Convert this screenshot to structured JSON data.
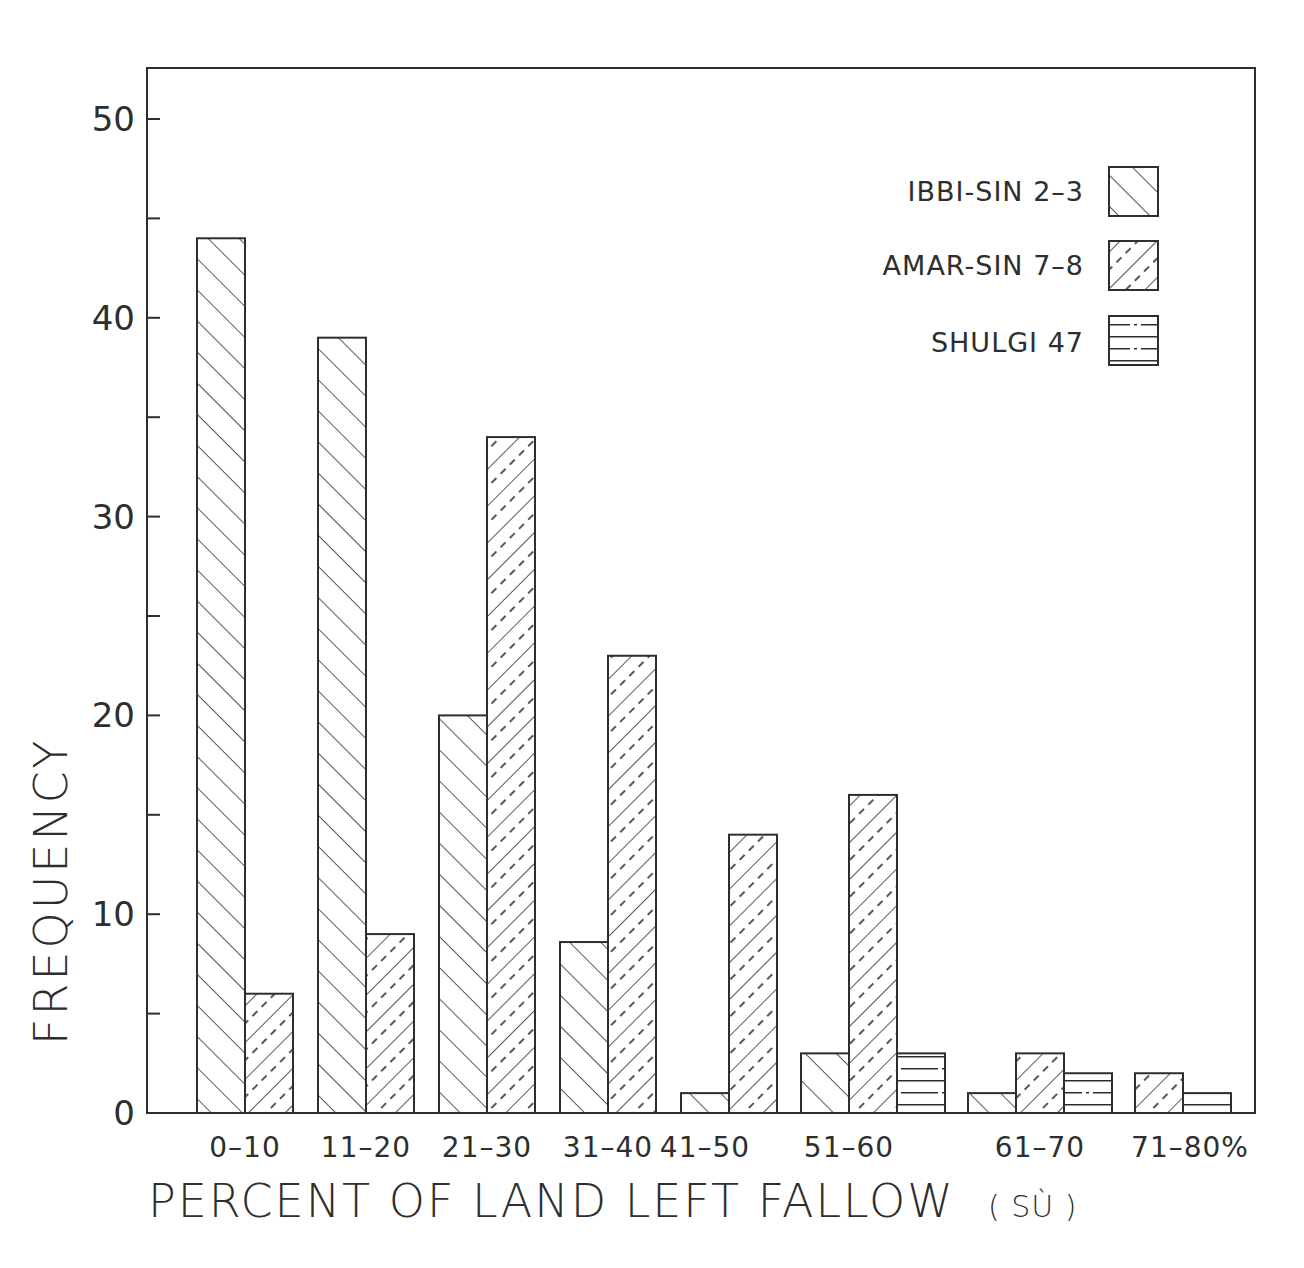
{
  "chart_data": {
    "type": "bar",
    "title": "",
    "xlabel": "PERCENT OF LAND LEFT FALLOW",
    "xlabel_unit": "( SÙ )",
    "ylabel": "FREQUENCY",
    "ylim": [
      0,
      52
    ],
    "yticks": [
      0,
      10,
      20,
      30,
      40,
      50
    ],
    "yticks_minor": [
      5,
      15,
      25,
      35,
      45
    ],
    "grid": false,
    "legend_position": "upper right",
    "categories": [
      "0–10",
      "11–20",
      "21–30",
      "31–40",
      "41–50",
      "51–60",
      "61–70",
      "71–80%"
    ],
    "series": [
      {
        "name": "IBBI-SIN 2–3",
        "pattern": "diagonal-forward",
        "values": [
          44,
          39,
          20,
          8.6,
          1,
          3,
          1,
          null
        ]
      },
      {
        "name": "AMAR-SIN 7–8",
        "pattern": "diagonal-backward-dashed",
        "values": [
          6,
          9,
          34,
          23,
          14,
          16,
          3,
          2
        ]
      },
      {
        "name": "SHULGI 47",
        "pattern": "horizontal-dashdot",
        "values": [
          null,
          null,
          null,
          null,
          null,
          3,
          2,
          1
        ]
      }
    ]
  },
  "legend": {
    "items": [
      {
        "label": "IBBI-SIN 2–3"
      },
      {
        "label": "AMAR-SIN 7–8"
      },
      {
        "label": "SHULGI 47"
      }
    ]
  },
  "axes": {
    "ylabel": "FREQUENCY",
    "xlabel": "PERCENT OF LAND LEFT FALLOW",
    "xlabel_unit": "( SÙ )"
  },
  "colors": {
    "ink": "#2e2e2e",
    "background": "#ffffff"
  }
}
